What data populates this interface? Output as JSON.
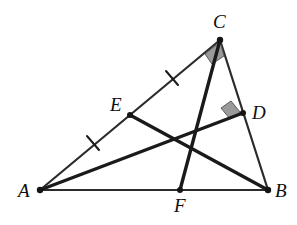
{
  "figure": {
    "width": 297,
    "height": 225,
    "background_color": "#ffffff",
    "stroke_color": "#1a1a1a",
    "thin_stroke_color": "#2b2b2b",
    "angle_marker_fill": "#9a9a9a",
    "angle_marker_stroke": "#4a4a4a"
  },
  "points": {
    "A": {
      "label": "A",
      "x": 40,
      "y": 190,
      "label_x": 18,
      "label_y": 181,
      "dot": true
    },
    "B": {
      "label": "B",
      "x": 268,
      "y": 190,
      "label_x": 275,
      "label_y": 181,
      "dot": true
    },
    "C": {
      "label": "C",
      "x": 220,
      "y": 40,
      "label_x": 213,
      "label_y": 12,
      "dot": true
    },
    "D": {
      "label": "D",
      "x": 243,
      "y": 113,
      "label_x": 252,
      "label_y": 103,
      "dot": true
    },
    "E": {
      "label": "E",
      "x": 130,
      "y": 115,
      "label_x": 110,
      "label_y": 95,
      "dot": true
    },
    "F": {
      "label": "F",
      "x": 180,
      "y": 190,
      "label_x": 174,
      "label_y": 196,
      "dot": true
    }
  },
  "segments": [
    {
      "name": "side-AB",
      "from": "A",
      "to": "B",
      "x1": 40,
      "y1": 190,
      "x2": 268,
      "y2": 190,
      "width": 2.2,
      "style": "thin"
    },
    {
      "name": "side-AC",
      "from": "A",
      "to": "C",
      "x1": 40,
      "y1": 190,
      "x2": 220,
      "y2": 40,
      "width": 2.2,
      "style": "thin"
    },
    {
      "name": "side-CB",
      "from": "C",
      "to": "B",
      "x1": 220,
      "y1": 40,
      "x2": 268,
      "y2": 190,
      "width": 2.2,
      "style": "thin"
    },
    {
      "name": "cevian-AD",
      "from": "A",
      "to": "D",
      "x1": 40,
      "y1": 190,
      "x2": 243,
      "y2": 113,
      "width": 3.4,
      "style": "thick"
    },
    {
      "name": "cevian-EB",
      "from": "E",
      "to": "B",
      "x1": 130,
      "y1": 115,
      "x2": 268,
      "y2": 190,
      "width": 3.4,
      "style": "thick"
    },
    {
      "name": "cevian-CF",
      "from": "C",
      "to": "F",
      "x1": 220,
      "y1": 40,
      "x2": 180,
      "y2": 190,
      "width": 3.4,
      "style": "thick"
    }
  ],
  "tick_marks": [
    {
      "name": "tick-AE",
      "on_segment": "A-E",
      "cx": 93,
      "cy": 143,
      "angle_deg": -39.8,
      "length": 15
    },
    {
      "name": "tick-EC",
      "on_segment": "E-C",
      "cx": 172,
      "cy": 78,
      "angle_deg": -39.8,
      "length": 15
    }
  ],
  "right_angles": [
    {
      "name": "right-angle-at-C",
      "vertex": "C",
      "between": "AC and CF",
      "points": "220,42 205,54 212,64 224,56",
      "fill": "#9a9a9a"
    },
    {
      "name": "right-angle-at-D",
      "vertex": "D",
      "between": "AD and CB",
      "points": "240,112 231,101 221,108 230,119",
      "fill": "#9a9a9a"
    }
  ],
  "annotations": {
    "description": "Triangle ABC. E is the midpoint of AC (shown by equal tick marks on AE and EC). CF is perpendicular to AC at C. AD is perpendicular to CB at D. Cevians AD, BE, and CF are drawn."
  }
}
